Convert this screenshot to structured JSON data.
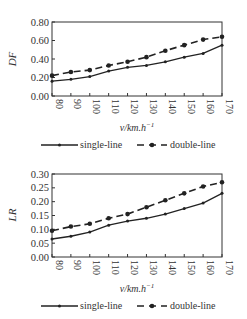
{
  "chart_data": [
    {
      "type": "line",
      "title": "",
      "xlabel": "v/km.h^-1",
      "ylabel": "DF",
      "x": [
        80,
        90,
        100,
        110,
        120,
        130,
        140,
        150,
        160,
        170
      ],
      "ylim": [
        0,
        0.8
      ],
      "yticks": [
        "0.00",
        "0.20",
        "0.40",
        "0.60",
        "0.80"
      ],
      "xticks": [
        "80",
        "90",
        "100",
        "110",
        "120",
        "130",
        "140",
        "150",
        "160",
        "170"
      ],
      "grid": false,
      "legend_position": "bottom",
      "series": [
        {
          "name": "single-line",
          "style": "solid",
          "marker": "small-dot",
          "values": [
            0.16,
            0.18,
            0.21,
            0.27,
            0.31,
            0.33,
            0.37,
            0.42,
            0.46,
            0.55
          ]
        },
        {
          "name": "double-line",
          "style": "dashed",
          "marker": "dot",
          "values": [
            0.22,
            0.26,
            0.28,
            0.33,
            0.37,
            0.42,
            0.49,
            0.55,
            0.61,
            0.64
          ]
        }
      ]
    },
    {
      "type": "line",
      "title": "",
      "xlabel": "v/km.h^-1",
      "ylabel": "LR",
      "x": [
        80,
        90,
        100,
        110,
        120,
        130,
        140,
        150,
        160,
        170
      ],
      "ylim": [
        0,
        0.3
      ],
      "yticks": [
        "0.00",
        "0.05",
        "0.10",
        "0.15",
        "0.20",
        "0.25",
        "0.30"
      ],
      "xticks": [
        "80",
        "90",
        "100",
        "110",
        "120",
        "130",
        "140",
        "150",
        "160",
        "170"
      ],
      "grid": false,
      "legend_position": "bottom",
      "series": [
        {
          "name": "single-line",
          "style": "solid",
          "marker": "small-dot",
          "values": [
            0.065,
            0.075,
            0.09,
            0.115,
            0.13,
            0.14,
            0.155,
            0.175,
            0.195,
            0.23
          ]
        },
        {
          "name": "double-line",
          "style": "dashed",
          "marker": "dot",
          "values": [
            0.095,
            0.11,
            0.12,
            0.14,
            0.155,
            0.18,
            0.205,
            0.23,
            0.255,
            0.27
          ]
        }
      ]
    }
  ],
  "labels": {
    "top_ylabel": "DF",
    "bottom_ylabel": "LR",
    "xlabel_main": "v/km.h",
    "xlabel_sup": "−1",
    "legend_single": "single-line",
    "legend_double": "double-line"
  },
  "colors": {
    "line": "#222222",
    "axis": "#333333"
  }
}
